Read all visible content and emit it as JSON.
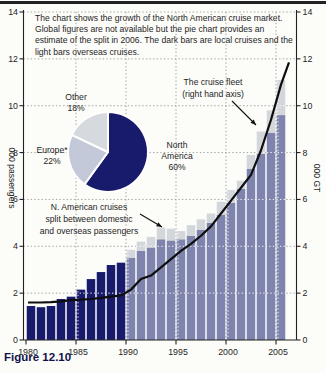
{
  "figure": {
    "caption": "Figure 12.10",
    "description": "The chart shows the growth of the North American cruise market. Global figures are not available but the pie chart provides an estimate of the split in 2006. The dark bars are local cruises and the light bars overseas cruises."
  },
  "chart_data": [
    {
      "type": "bar",
      "stacked": true,
      "x": [
        1980,
        1981,
        1982,
        1983,
        1984,
        1985,
        1986,
        1987,
        1988,
        1989,
        1990,
        1991,
        1992,
        1993,
        1994,
        1995,
        1996,
        1997,
        1998,
        1999,
        2000,
        2001,
        2002,
        2003,
        2004,
        2005
      ],
      "series": [
        {
          "name": "Local cruises (domestic passengers)",
          "color_1980s": "#181a6b",
          "color_from_1990": "#7e84ad",
          "values": [
            1.45,
            1.4,
            1.45,
            1.75,
            1.85,
            2.15,
            2.6,
            2.9,
            3.2,
            3.3,
            3.5,
            3.8,
            3.95,
            4.3,
            4.25,
            4.3,
            4.45,
            4.7,
            5.0,
            5.35,
            5.85,
            6.45,
            7.3,
            7.95,
            8.85,
            9.6
          ]
        },
        {
          "name": "Overseas passengers",
          "color": "#d3d7db",
          "values": [
            0,
            0,
            0,
            0,
            0,
            0,
            0,
            0,
            0,
            0,
            0.35,
            0.4,
            0.45,
            0.5,
            0.5,
            0.35,
            0.45,
            0.45,
            0.4,
            0.55,
            0.55,
            0.35,
            0.6,
            0.95,
            0.95,
            1.5
          ]
        }
      ],
      "line_series": {
        "name": "The cruise fleet",
        "axis": "right",
        "color": "#0e0e0e",
        "points": [
          [
            1979.7,
            1.6
          ],
          [
            1980,
            1.6
          ],
          [
            1981,
            1.6
          ],
          [
            1982,
            1.62
          ],
          [
            1983,
            1.65
          ],
          [
            1984,
            1.7
          ],
          [
            1985,
            1.72
          ],
          [
            1986,
            1.75
          ],
          [
            1987,
            1.8
          ],
          [
            1988,
            1.85
          ],
          [
            1989,
            1.9
          ],
          [
            1990,
            2.15
          ],
          [
            1991,
            2.6
          ],
          [
            1992,
            2.75
          ],
          [
            1993,
            3.1
          ],
          [
            1994,
            3.45
          ],
          [
            1995,
            3.8
          ],
          [
            1996,
            4.1
          ],
          [
            1997,
            4.45
          ],
          [
            1998,
            4.85
          ],
          [
            1999,
            5.4
          ],
          [
            2000,
            5.95
          ],
          [
            2001,
            6.5
          ],
          [
            2002,
            7.05
          ],
          [
            2003,
            8.1
          ],
          [
            2004,
            9.4
          ],
          [
            2005,
            10.9
          ],
          [
            2005.8,
            11.85
          ]
        ]
      },
      "left_axis": {
        "label": "000 passengers",
        "ticks": [
          0,
          2,
          4,
          6,
          8,
          10,
          12,
          14
        ],
        "lim": [
          0,
          14
        ]
      },
      "right_axis": {
        "label": "000 GT",
        "ticks": [
          0,
          2,
          4,
          6,
          8,
          10,
          12,
          14
        ],
        "lim": [
          0,
          14
        ]
      },
      "x_ticks": [
        1980,
        1985,
        1990,
        1995,
        2000,
        2005
      ],
      "grid": "dotted",
      "annotations": [
        {
          "id": "fleet",
          "lines": [
            "The cruise fleet",
            "(right hand axis)"
          ]
        },
        {
          "id": "nacruise",
          "lines": [
            "N. American cruises",
            "split between domestic",
            "and overseas passengers"
          ]
        }
      ]
    },
    {
      "type": "pie",
      "year": 2006,
      "direction": "clockwise",
      "start": "12 o'clock",
      "slices": [
        {
          "label": "North America",
          "pct": 60,
          "color": "#181a6b"
        },
        {
          "label": "Europe*",
          "pct": 22,
          "color": "#c4c9da"
        },
        {
          "label": "Other",
          "pct": 18,
          "color": "#d6d9dd"
        }
      ]
    }
  ]
}
